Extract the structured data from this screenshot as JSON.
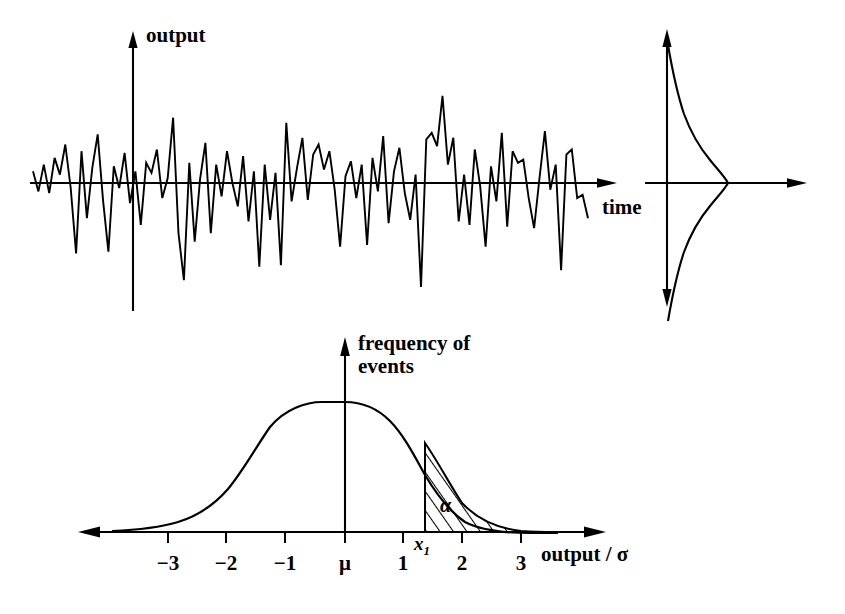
{
  "figure": {
    "background_color": "#ffffff",
    "ink_color": "#000000"
  },
  "panels": {
    "signal": {
      "name": "noise-time-series",
      "y_axis_label": "output",
      "x_axis_label": "time"
    },
    "side_distribution": {
      "name": "amplitude-distribution-sideways",
      "y_axis_label": "",
      "x_axis_label": ""
    },
    "histogram": {
      "name": "frequency-of-events-distribution",
      "y_axis_label": "frequency of\nevents",
      "y_axis_label_line1": "frequency of",
      "y_axis_label_line2": "events",
      "x_axis_label": "output / σ",
      "shaded_region_label": "α",
      "threshold_label": "x₁",
      "threshold_label_base": "x",
      "threshold_label_sub": "1",
      "tick_labels": [
        "−3",
        "−2",
        "−1",
        "μ",
        "1",
        "2",
        "3"
      ]
    }
  },
  "chart_data": [
    {
      "type": "line",
      "name": "noise-time-series",
      "title": "",
      "xlabel": "time",
      "ylabel": "output",
      "grid": false,
      "legend": "none",
      "xlim": [
        0,
        100
      ],
      "ylim": [
        -3.4,
        3.4
      ],
      "axis_origin_x_fraction": 0.18,
      "values": [
        0.35,
        -0.25,
        0.55,
        -0.3,
        0.75,
        0.25,
        1.15,
        -0.15,
        -2.1,
        0.95,
        -1.05,
        0.45,
        1.45,
        -0.5,
        -2.05,
        0.5,
        -0.15,
        0.9,
        -0.6,
        0.35,
        -1.25,
        0.6,
        0.3,
        1.0,
        -0.45,
        0.15,
        1.95,
        -1.5,
        -2.9,
        0.6,
        -1.75,
        0.1,
        1.2,
        -1.5,
        0.55,
        -0.4,
        0.95,
        0.0,
        -0.7,
        0.8,
        -1.15,
        0.35,
        -2.5,
        0.55,
        -1.1,
        0.3,
        -2.45,
        1.8,
        -0.55,
        0.45,
        1.35,
        -0.5,
        0.85,
        1.15,
        0.4,
        0.95,
        -0.2,
        -1.9,
        0.2,
        0.65,
        -0.45,
        0.55,
        -1.85,
        0.75,
        -0.25,
        1.4,
        -1.2,
        0.35,
        1.05,
        -0.3,
        -1.1,
        0.25,
        -3.1,
        1.3,
        1.5,
        1.1,
        2.6,
        0.55,
        1.35,
        -1.15,
        0.25,
        -1.25,
        1.0,
        -0.1,
        -1.9,
        0.5,
        -0.55,
        1.5,
        -1.3,
        0.95,
        0.6,
        0.7,
        -0.45,
        -1.35,
        0.15,
        1.55,
        -0.2,
        0.55,
        -2.6,
        0.85,
        1.0,
        -0.45,
        -0.35,
        -1.05
      ]
    },
    {
      "type": "line",
      "name": "amplitude-distribution-sideways",
      "title": "",
      "xlabel": "",
      "ylabel": "",
      "grid": false,
      "legend": "none",
      "orientation": "horizontal-density",
      "distribution": "gaussian",
      "mean": 0,
      "sigma": 1,
      "xlim": [
        0,
        1
      ],
      "ylim": [
        -3.4,
        3.4
      ]
    },
    {
      "type": "area",
      "name": "frequency-of-events-distribution",
      "title": "",
      "xlabel": "output / σ",
      "ylabel": "frequency of events",
      "grid": false,
      "legend": "none",
      "distribution": "gaussian",
      "mean": 0,
      "sigma": 1,
      "xlim": [
        -3.9,
        4.5
      ],
      "ylim": [
        0,
        1.06
      ],
      "x_ticks": [
        -3,
        -2,
        -1,
        0,
        1,
        2,
        3
      ],
      "x_tick_labels": [
        "−3",
        "−2",
        "−1",
        "μ",
        "1",
        "2",
        "3"
      ],
      "threshold_x": 1.37,
      "threshold_label": "x₁",
      "shaded_area_from": 1.37,
      "shaded_area_to": 4.0,
      "shaded_area_label": "α",
      "shading_style": "diagonal-hatch"
    }
  ]
}
